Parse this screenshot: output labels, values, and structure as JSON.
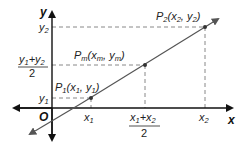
{
  "diagram": {
    "axes": {
      "x_label": "x",
      "y_label": "y",
      "origin_label": "O"
    },
    "points": [
      {
        "id": "P1",
        "name": "P",
        "sub": "1",
        "coords": "(x₁, y₁)",
        "x_tick": "x₁",
        "y_tick": "y₁"
      },
      {
        "id": "Pm",
        "name": "P",
        "sub": "m",
        "coords": "(xₘ, yₘ)",
        "x_tick": "(x₁+x₂)/2",
        "y_tick": "(y₁+y₂)/2"
      },
      {
        "id": "P2",
        "name": "P",
        "sub": "2",
        "coords": "(x₂, y₂)",
        "x_tick": "x₂",
        "y_tick": "y₂"
      }
    ],
    "tick_labels": {
      "y2": "y",
      "y2_sub": "2",
      "ym_num_a": "y",
      "ym_num_a_sub": "1",
      "ym_plus": "+",
      "ym_num_b": "y",
      "ym_num_b_sub": "2",
      "ym_den": "2",
      "y1": "y",
      "y1_sub": "1",
      "x1": "x",
      "x1_sub": "1",
      "xm_num_a": "x",
      "xm_num_a_sub": "1",
      "xm_plus": "+",
      "xm_num_b": "x",
      "xm_num_b_sub": "2",
      "xm_den": "2",
      "x2": "x",
      "x2_sub": "2"
    },
    "point_labels": {
      "p2_main": "P",
      "p2_sub": "2",
      "p2_open": "(x",
      "p2_xs": "2",
      "p2_mid": ", y",
      "p2_ys": "2",
      "p2_close": ")",
      "pm_main": "P",
      "pm_sub": "m",
      "pm_open": "(x",
      "pm_xs": "m",
      "pm_mid": ", y",
      "pm_ys": "m",
      "pm_close": ")",
      "p1_main": "P",
      "p1_sub": "1",
      "p1_open": "(x",
      "p1_xs": "1",
      "p1_mid": ", y",
      "p1_ys": "1",
      "p1_close": ")"
    },
    "colors": {
      "axis": "#111111",
      "line": "#555555",
      "dashed": "#888888",
      "point": "#333333"
    }
  }
}
